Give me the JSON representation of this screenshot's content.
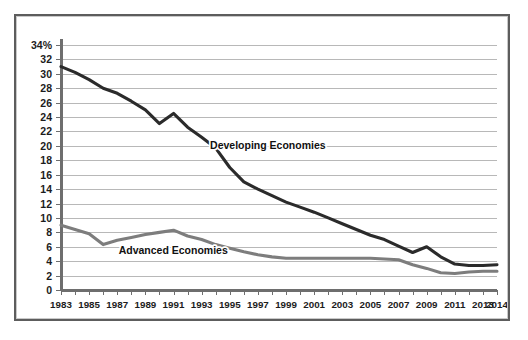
{
  "chart_data": {
    "type": "line",
    "title": "",
    "xlabel": "",
    "ylabel": "",
    "grid": true,
    "legend_position": "inline-annotation",
    "xlim": [
      1983,
      2014
    ],
    "ylim": [
      0,
      34
    ],
    "y_tick_step": 2,
    "y_ticks": [
      "0",
      "2",
      "4",
      "6",
      "8",
      "10",
      "12",
      "14",
      "16",
      "18",
      "20",
      "22",
      "24",
      "26",
      "28",
      "30",
      "32",
      "34%"
    ],
    "y_tick_values": [
      0,
      2,
      4,
      6,
      8,
      10,
      12,
      14,
      16,
      18,
      20,
      22,
      24,
      26,
      28,
      30,
      32,
      34
    ],
    "y_axis_unit": "%",
    "x_ticks_all_years": [
      1983,
      1984,
      1985,
      1986,
      1987,
      1988,
      1989,
      1990,
      1991,
      1992,
      1993,
      1994,
      1995,
      1996,
      1997,
      1998,
      1999,
      2000,
      2001,
      2002,
      2003,
      2004,
      2005,
      2006,
      2007,
      2008,
      2009,
      2010,
      2011,
      2012,
      2013,
      2014
    ],
    "x_tick_labels": [
      "1983",
      "1985",
      "1987",
      "1989",
      "1991",
      "1993",
      "1995",
      "1997",
      "1999",
      "2001",
      "2003",
      "2005",
      "2007",
      "2009",
      "2011",
      "2013",
      "2014"
    ],
    "x_labeled_values": [
      1983,
      1985,
      1987,
      1989,
      1991,
      1993,
      1995,
      1997,
      1999,
      2001,
      2003,
      2005,
      2007,
      2009,
      2011,
      2013,
      2014
    ],
    "x": [
      1983,
      1984,
      1985,
      1986,
      1987,
      1988,
      1989,
      1990,
      1991,
      1992,
      1993,
      1994,
      1995,
      1996,
      1997,
      1998,
      1999,
      2000,
      2001,
      2002,
      2003,
      2004,
      2005,
      2006,
      2007,
      2008,
      2009,
      2010,
      2011,
      2012,
      2013,
      2014
    ],
    "series": [
      {
        "name": "Developing Economies",
        "color": "#2b2b2b",
        "label_x": 1993.6,
        "label_y": 19.6,
        "values": [
          31.0,
          30.2,
          29.2,
          28.0,
          27.3,
          26.2,
          25.0,
          23.1,
          24.5,
          22.6,
          21.2,
          19.7,
          17.0,
          15.0,
          14.0,
          13.1,
          12.2,
          11.5,
          10.8,
          10.0,
          9.2,
          8.4,
          7.6,
          7.0,
          6.1,
          5.2,
          6.0,
          4.6,
          3.6,
          3.4,
          3.4,
          3.5
        ]
      },
      {
        "name": "Advanced Economies",
        "color": "#7d7d7d",
        "label_x": 1987.1,
        "label_y": 5.0,
        "values": [
          9.0,
          8.4,
          7.8,
          6.3,
          6.9,
          7.3,
          7.7,
          8.0,
          8.3,
          7.5,
          7.0,
          6.3,
          5.8,
          5.3,
          4.9,
          4.6,
          4.4,
          4.4,
          4.4,
          4.4,
          4.4,
          4.4,
          4.4,
          4.3,
          4.2,
          3.5,
          3.0,
          2.4,
          2.3,
          2.5,
          2.6,
          2.6
        ]
      }
    ]
  },
  "style": {
    "border_color": "#5d5d5d",
    "grid_color": "#b8b8b8",
    "axis_color": "#6e6e6e",
    "background": "#ffffff"
  }
}
